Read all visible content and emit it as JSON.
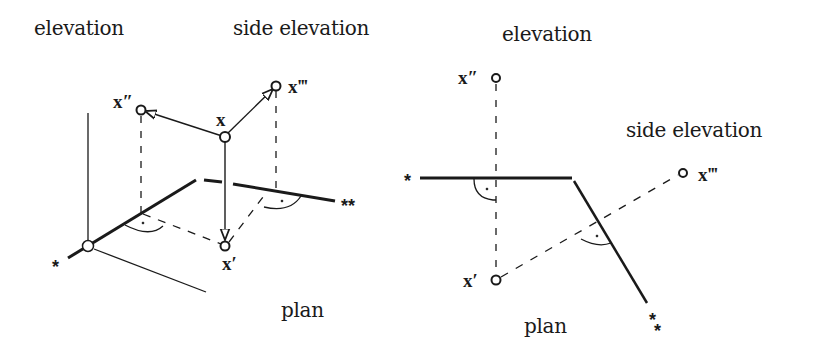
{
  "left_figure": {
    "labels": {
      "elevation": "elevation",
      "side_elevation": "side elevation",
      "plan": "plan",
      "x": "x",
      "x_double": "x″",
      "x_triple": "x‴",
      "x_single": "x′",
      "axis_star_1": "*",
      "axis_star_2": "**"
    }
  },
  "right_figure": {
    "labels": {
      "elevation": "elevation",
      "side_elevation": "side elevation",
      "plan": "plan",
      "x_double": "x″",
      "x_triple": "x‴",
      "x_single": "x′",
      "axis_star_1": "*",
      "axis_star_2": "*",
      "axis_star_2b": "*"
    }
  },
  "colors": {
    "ink": "#1a1a1a",
    "background": "#ffffff"
  }
}
